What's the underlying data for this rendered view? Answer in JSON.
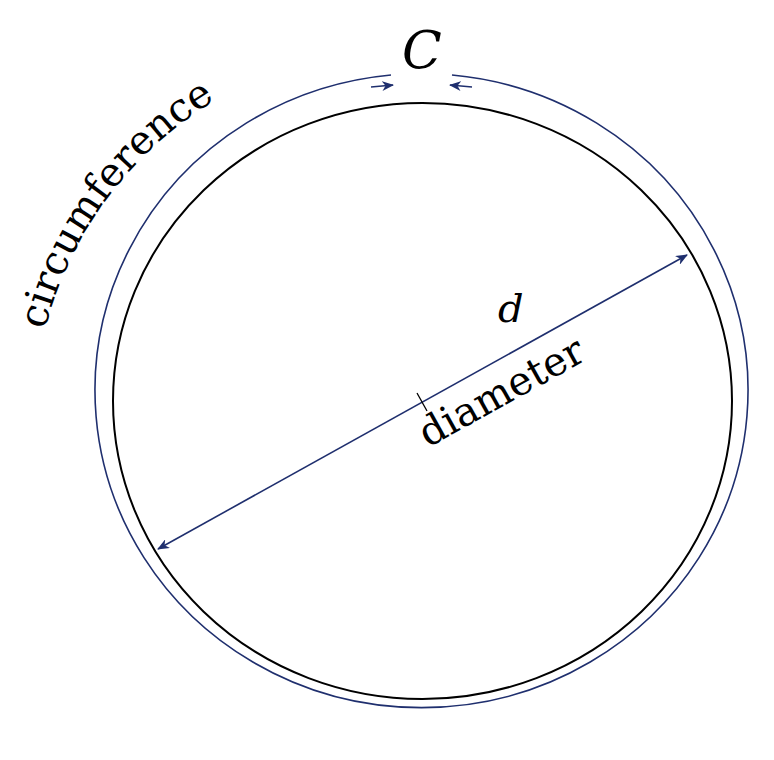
{
  "diagram": {
    "labels": {
      "circumference_word": "circumference",
      "circumference_symbol": "C",
      "diameter_word": "diameter",
      "diameter_symbol": "d"
    },
    "colors": {
      "background": "#ffffff",
      "circle_stroke": "#000000",
      "annotation_stroke": "#1f2f6e",
      "text": "#000000"
    }
  }
}
